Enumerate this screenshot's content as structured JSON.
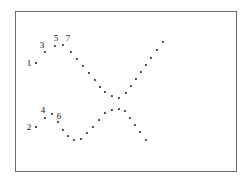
{
  "figure": {
    "background_color": "#ffffff",
    "frame": {
      "x": 15,
      "y": 11,
      "width": 222,
      "height": 161,
      "border_color": "#6b6b6b",
      "border_width": 1
    },
    "marker_color": "#1a1a1a",
    "label_color": "#111111"
  },
  "chart_data": {
    "type": "scatter",
    "title": "",
    "xlabel": "",
    "ylabel": "",
    "grid": false,
    "legend": null,
    "axis_ticks": false,
    "xlim": [
      15,
      237
    ],
    "ylim": [
      11,
      172
    ],
    "note": "Two dot trajectories crossing in an X pattern; seven numbered annotations mark points in the two left-hand clusters.",
    "series": [
      {
        "name": "upper-descending-branch",
        "points": [
          {
            "x": 36,
            "y": 63
          },
          {
            "x": 45,
            "y": 52
          },
          {
            "x": 55,
            "y": 46
          },
          {
            "x": 63,
            "y": 45
          },
          {
            "x": 71,
            "y": 52
          },
          {
            "x": 77,
            "y": 59
          },
          {
            "x": 83,
            "y": 66
          },
          {
            "x": 89,
            "y": 73
          },
          {
            "x": 95,
            "y": 80
          },
          {
            "x": 100,
            "y": 87
          },
          {
            "x": 105,
            "y": 92
          },
          {
            "x": 112,
            "y": 96
          },
          {
            "x": 119,
            "y": 98
          }
        ]
      },
      {
        "name": "upper-ascending-branch",
        "points": [
          {
            "x": 119,
            "y": 98
          },
          {
            "x": 126,
            "y": 93
          },
          {
            "x": 131,
            "y": 86
          },
          {
            "x": 136,
            "y": 79
          },
          {
            "x": 141,
            "y": 72
          },
          {
            "x": 146,
            "y": 65
          },
          {
            "x": 151,
            "y": 58
          },
          {
            "x": 157,
            "y": 50
          },
          {
            "x": 163,
            "y": 42
          }
        ]
      },
      {
        "name": "lower-descending-branch",
        "points": [
          {
            "x": 36,
            "y": 127
          },
          {
            "x": 45,
            "y": 118
          },
          {
            "x": 52,
            "y": 114
          },
          {
            "x": 58,
            "y": 122
          },
          {
            "x": 63,
            "y": 130
          },
          {
            "x": 68,
            "y": 136
          },
          {
            "x": 74,
            "y": 140
          },
          {
            "x": 81,
            "y": 139
          }
        ]
      },
      {
        "name": "lower-rising-branch",
        "points": [
          {
            "x": 81,
            "y": 139
          },
          {
            "x": 87,
            "y": 133
          },
          {
            "x": 93,
            "y": 127
          },
          {
            "x": 99,
            "y": 120
          },
          {
            "x": 105,
            "y": 113
          },
          {
            "x": 112,
            "y": 110
          },
          {
            "x": 119,
            "y": 109
          }
        ]
      },
      {
        "name": "lower-falling-branch",
        "points": [
          {
            "x": 119,
            "y": 109
          },
          {
            "x": 125,
            "y": 111
          },
          {
            "x": 130,
            "y": 118
          },
          {
            "x": 135,
            "y": 125
          },
          {
            "x": 140,
            "y": 132
          },
          {
            "x": 146,
            "y": 140
          }
        ]
      }
    ],
    "annotations": [
      {
        "label": "1",
        "x": 29,
        "y": 63,
        "point_x": 36,
        "point_y": 63
      },
      {
        "label": "2",
        "x": 29,
        "y": 127,
        "point_x": 36,
        "point_y": 127
      },
      {
        "label": "3",
        "x": 42,
        "y": 45,
        "point_x": 45,
        "point_y": 52
      },
      {
        "label": "4",
        "x": 43,
        "y": 110,
        "point_x": 45,
        "point_y": 118
      },
      {
        "label": "5",
        "x": 56,
        "y": 38,
        "point_x": 55,
        "point_y": 46
      },
      {
        "label": "6",
        "x": 59,
        "y": 116,
        "point_x": 52,
        "point_y": 114
      },
      {
        "label": "7",
        "x": 68,
        "y": 38,
        "point_x": 63,
        "point_y": 45
      }
    ]
  }
}
